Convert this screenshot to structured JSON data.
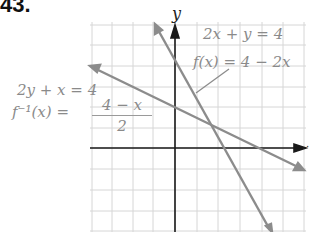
{
  "problem_number": "43.",
  "axes": {
    "x_label": "x",
    "y_label": "y"
  },
  "labels": {
    "eq1": "2x + y = 4",
    "f": "f(x) = 4 − 2x",
    "eq2": "2y + x = 4",
    "finv_lhs": "f⁻¹(x) =",
    "finv_num": "4 − x",
    "finv_den": "2"
  },
  "colors": {
    "grid": "#d6d6d6",
    "axis": "#1a1a1a",
    "line": "#8c8c8c",
    "text": "#8a8a8a"
  },
  "chart_data": {
    "type": "line",
    "title": "43.",
    "xlabel": "x",
    "ylabel": "y",
    "xlim": [
      -4,
      6
    ],
    "ylim": [
      -4,
      6
    ],
    "grid": true,
    "grid_step": 1,
    "series": [
      {
        "name": "f(x) = 4 − 2x  (2x + y = 4)",
        "x": [
          -1,
          4.5
        ],
        "y": [
          6,
          -5
        ]
      },
      {
        "name": "f⁻¹(x) = (4 − x)/2  (2y + x = 4)",
        "x": [
          -4,
          6
        ],
        "y": [
          4,
          -1
        ]
      }
    ],
    "annotations": [
      "2x + y = 4",
      "f(x) = 4 − 2x",
      "2y + x = 4",
      "f⁻¹(x) = (4 − x)/2"
    ]
  }
}
